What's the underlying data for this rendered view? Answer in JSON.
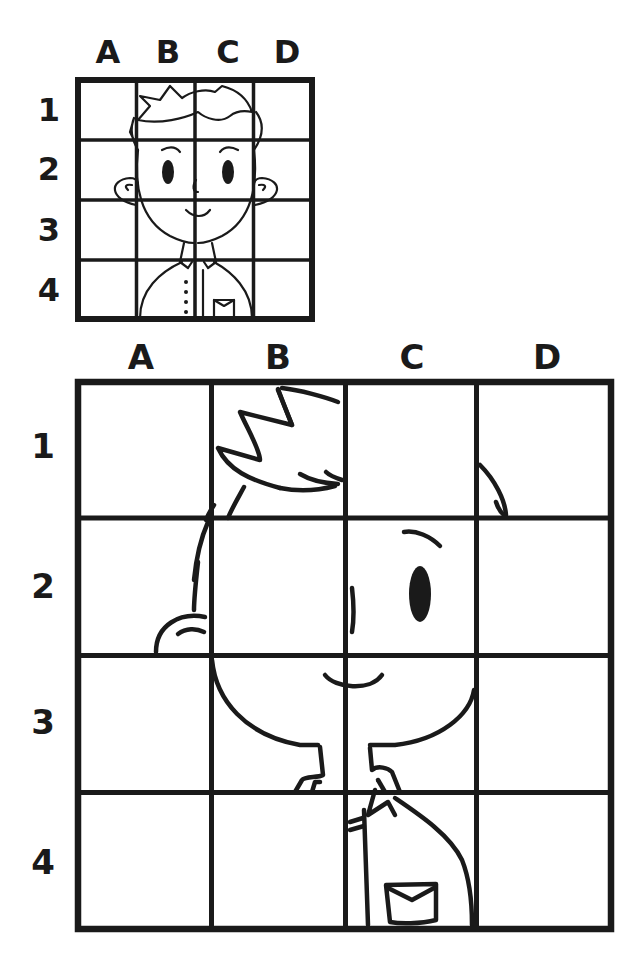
{
  "reference_grid": {
    "columns": [
      "A",
      "B",
      "C",
      "D"
    ],
    "rows": [
      "1",
      "2",
      "3",
      "4"
    ],
    "content": "complete boy portrait (hair, face, ears, eyes, nose, smile, collar, shirt with buttons, pocket)"
  },
  "practice_grid": {
    "columns": [
      "A",
      "B",
      "C",
      "D"
    ],
    "rows": [
      "1",
      "2",
      "3",
      "4"
    ],
    "content": "partial enlarged boy portrait to be completed"
  },
  "colors": {
    "ink": "#1a1a1a",
    "background": "#ffffff"
  }
}
